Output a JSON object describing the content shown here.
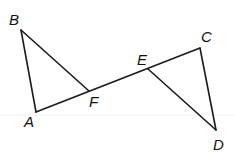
{
  "diagram": {
    "background": "#ffffff",
    "stroke_color": "#1a1a1a",
    "points": {
      "A": {
        "label": "A",
        "x": 36,
        "y": 112
      },
      "B": {
        "label": "B",
        "x": 21,
        "y": 30
      },
      "F": {
        "label": "F",
        "x": 89,
        "y": 91
      },
      "E": {
        "label": "E",
        "x": 148,
        "y": 69
      },
      "C": {
        "label": "C",
        "x": 200,
        "y": 48
      },
      "D": {
        "label": "D",
        "x": 216,
        "y": 130
      }
    },
    "segments": [
      [
        "A",
        "B"
      ],
      [
        "B",
        "F"
      ],
      [
        "A",
        "C"
      ],
      [
        "C",
        "D"
      ],
      [
        "E",
        "D"
      ]
    ],
    "triangles": [
      "ABF",
      "CDE"
    ]
  }
}
